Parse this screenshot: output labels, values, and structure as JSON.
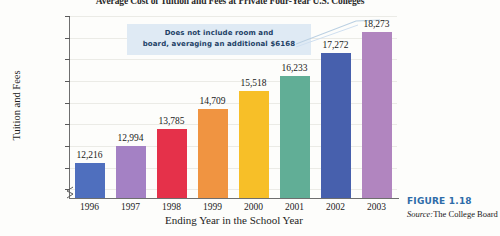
{
  "chart_data": {
    "type": "bar",
    "title": "Average Cost of Tuition and Fees at Private Four-Year U.S. Colleges",
    "xlabel": "Ending Year in the School Year",
    "ylabel": "Tuition and Fees",
    "categories": [
      "1996",
      "1997",
      "1998",
      "1999",
      "2000",
      "2001",
      "2002",
      "2003"
    ],
    "values": [
      12216,
      12994,
      13785,
      14709,
      15518,
      16233,
      17272,
      18273
    ],
    "value_labels": [
      "12,216",
      "12,994",
      "13,785",
      "14,709",
      "15,518",
      "16,233",
      "17,272",
      "18,273"
    ],
    "bar_colors": [
      "#4f6fbe",
      "#a481c4",
      "#e5314a",
      "#f09441",
      "#f7bf28",
      "#61ae96",
      "#4760ad",
      "#b185bf"
    ],
    "ylim": [
      10600,
      19000
    ],
    "ytick_values": [
      11000,
      12000,
      13000,
      14000,
      15000,
      16000,
      17000,
      18000,
      19000
    ],
    "ytick_labels": [
      "$11,000",
      "$12,000",
      "$13,000",
      "$14,000",
      "$15,000",
      "$16,000",
      "$17,000",
      "$18,000",
      "$19,000"
    ],
    "grid": true,
    "axis_break": true,
    "legend": "none",
    "annotations": [
      {
        "text_line_1": "Does not include room and",
        "text_line_2": "board, averaging an additional $6168",
        "background": "#dfeaf4",
        "text_color": "#1d3f66",
        "points_to": "2003"
      }
    ]
  },
  "callout": {
    "line1": "Does not include room and",
    "line2": "board, averaging an additional $6168"
  },
  "caption": {
    "figure_number": "FIGURE 1.18",
    "source_prefix": "Source:",
    "source_text": "The College Board"
  }
}
